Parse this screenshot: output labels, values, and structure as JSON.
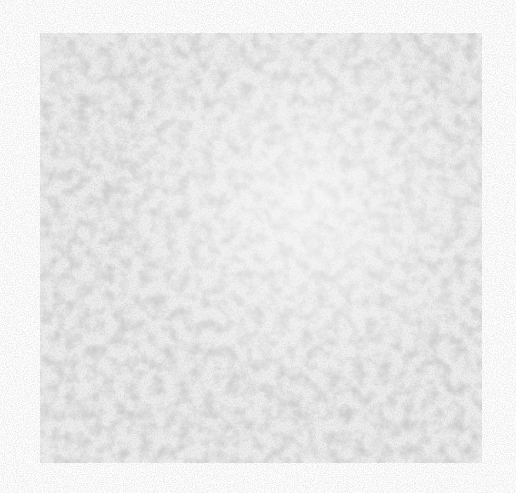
{
  "image": {
    "description": "Grayscale noise texture square on white background",
    "background_color": "#ffffff",
    "square": {
      "x": 40,
      "y": 33,
      "width": 442,
      "height": 430,
      "base_color": "#e4e4e4",
      "speckle_color": "#9a9a9a"
    }
  }
}
